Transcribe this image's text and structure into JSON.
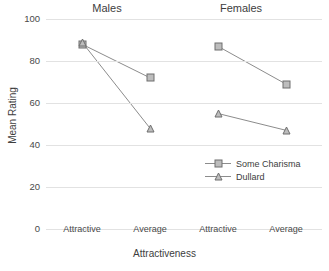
{
  "chart_data": {
    "type": "line",
    "title": "",
    "xlabel": "Attractiveness",
    "ylabel": "Mean Rating",
    "ylim": [
      0,
      100
    ],
    "yticks": [
      0,
      20,
      40,
      60,
      80,
      100
    ],
    "grid": true,
    "legend_position": "inside-right-lower",
    "panels": [
      {
        "title": "Males",
        "categories": [
          "Attractive",
          "Average"
        ],
        "series": [
          {
            "name": "Some Charisma",
            "marker": "square",
            "values": [
              88,
              72
            ]
          },
          {
            "name": "Dullard",
            "marker": "triangle",
            "values": [
              89,
              48
            ]
          }
        ]
      },
      {
        "title": "Females",
        "categories": [
          "Attractive",
          "Average"
        ],
        "series": [
          {
            "name": "Some Charisma",
            "marker": "square",
            "values": [
              87,
              69
            ]
          },
          {
            "name": "Dullard",
            "marker": "triangle",
            "values": [
              55,
              47
            ]
          }
        ]
      }
    ],
    "legend": [
      {
        "name": "Some Charisma",
        "marker": "square"
      },
      {
        "name": "Dullard",
        "marker": "triangle"
      }
    ],
    "colors": {
      "line": "#8c8c8c",
      "marker_fill": "#bdbdbd",
      "marker_edge": "#6e6e6e",
      "grid": "#e2e2e2",
      "text": "#3d3d3d",
      "background": "#ffffff"
    }
  },
  "axis": {
    "ytick_labels": [
      "100",
      "80",
      "60",
      "40",
      "20",
      "0"
    ],
    "xtick_labels": [
      "Attractive",
      "Average",
      "Attractive",
      "Average"
    ]
  },
  "titles": {
    "panel_males": "Males",
    "panel_females": "Females",
    "x_axis": "Attractiveness",
    "y_axis": "Mean Rating"
  },
  "legend_labels": {
    "some_charisma": "Some Charisma",
    "dullard": "Dullard"
  }
}
